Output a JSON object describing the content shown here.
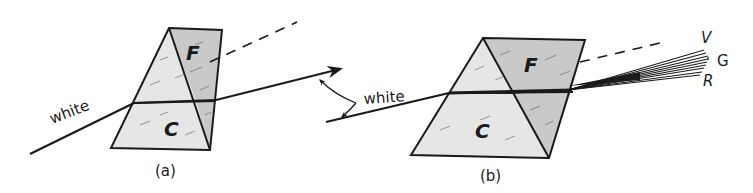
{
  "figure": {
    "colors": {
      "ink": "#1a1a1a",
      "crown_fill": "#e6e6e6",
      "flint_fill": "#c9c9c9",
      "background": "#ffffff"
    },
    "panel_a": {
      "caption": "(a)",
      "ray_label": "white",
      "prism_labels": {
        "flint": "F",
        "crown": "C"
      }
    },
    "panel_b": {
      "caption": "(b)",
      "ray_label": "white",
      "prism_labels": {
        "flint": "F",
        "crown": "C"
      },
      "spectrum_labels": {
        "violet": "V",
        "green": "G",
        "red": "R"
      }
    }
  }
}
